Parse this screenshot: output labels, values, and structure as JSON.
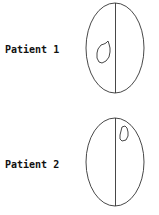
{
  "diagram": {
    "patients": [
      {
        "label": "Patient 1",
        "lesion_side": "left"
      },
      {
        "label": "Patient 2",
        "lesion_side": "right"
      }
    ]
  },
  "colors": {
    "stroke": "#333333",
    "text": "#111111",
    "background": "#ffffff"
  }
}
